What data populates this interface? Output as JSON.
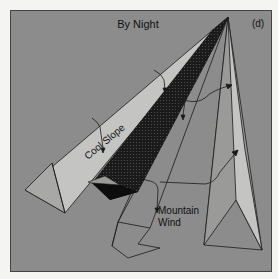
{
  "diagram": {
    "title": "By Night",
    "panel_label": "(d)",
    "labels": {
      "slope": "Cool Slope",
      "wind_line1": "Mountain",
      "wind_line2": "Wind"
    },
    "colors": {
      "background": "#8c8c8c",
      "frame_outer": "#f4f4f2",
      "slope_light": "#c4c4c2",
      "slope_mid": "#a8a8a6",
      "valley_dark": "#1a1a1a",
      "line": "#1a1a1a"
    }
  }
}
